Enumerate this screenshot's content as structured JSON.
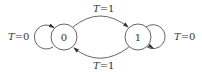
{
  "diagram": {
    "type": "state-diagram",
    "states": [
      {
        "id": "s0",
        "label": "0"
      },
      {
        "id": "s1",
        "label": "1"
      }
    ],
    "transitions": [
      {
        "from": "s0",
        "to": "s0",
        "label_var": "T",
        "label_val": "=0"
      },
      {
        "from": "s0",
        "to": "s1",
        "label_var": "T",
        "label_val": "=1"
      },
      {
        "from": "s1",
        "to": "s0",
        "label_var": "T",
        "label_val": "=1"
      },
      {
        "from": "s1",
        "to": "s1",
        "label_var": "T",
        "label_val": "=0"
      }
    ],
    "colors": {
      "stroke": "#555555",
      "text": "#333333",
      "background": "#ffffff"
    }
  }
}
